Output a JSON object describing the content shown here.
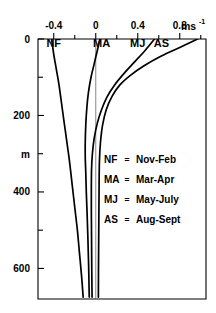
{
  "chart_data": {
    "type": "line",
    "title": "",
    "xlabel": "",
    "ylabel": "m",
    "xunit": "ms",
    "xunit_exponent": "-1",
    "orientation": "depth-profile",
    "grid": false,
    "legend_position": "inside-right-middle",
    "xlim": [
      -0.55,
      1.05
    ],
    "ylim": [
      0,
      680
    ],
    "y_inverted": true,
    "xticks": [
      -0.4,
      0,
      0.4,
      0.8
    ],
    "xtick_labels": [
      "-0.4",
      "0",
      "0.4",
      "0.8"
    ],
    "xminor_ticks": [
      -0.2,
      0.2,
      0.6,
      1.0
    ],
    "yticks": [
      0,
      200,
      400,
      600
    ],
    "ytick_labels": [
      "0",
      "200",
      "400",
      "600"
    ],
    "yminor_ticks": [
      100,
      300,
      500
    ],
    "zero_reference_line": 0,
    "series": [
      {
        "name": "NF",
        "label": "Nov-Feb",
        "points": [
          [
            -0.42,
            0
          ],
          [
            -0.4,
            40
          ],
          [
            -0.375,
            80
          ],
          [
            -0.35,
            120
          ],
          [
            -0.325,
            170
          ],
          [
            -0.3,
            220
          ],
          [
            -0.275,
            270
          ],
          [
            -0.25,
            320
          ],
          [
            -0.225,
            380
          ],
          [
            -0.2,
            440
          ],
          [
            -0.175,
            500
          ],
          [
            -0.155,
            560
          ],
          [
            -0.135,
            620
          ],
          [
            -0.12,
            675
          ]
        ]
      },
      {
        "name": "MA",
        "label": "Mar-Apr",
        "points": [
          [
            0.04,
            0
          ],
          [
            0.015,
            30
          ],
          [
            -0.015,
            65
          ],
          [
            -0.045,
            100
          ],
          [
            -0.07,
            140
          ],
          [
            -0.085,
            180
          ],
          [
            -0.095,
            225
          ],
          [
            -0.1,
            270
          ],
          [
            -0.1,
            310
          ],
          [
            -0.095,
            350
          ],
          [
            -0.09,
            400
          ],
          [
            -0.082,
            460
          ],
          [
            -0.075,
            520
          ],
          [
            -0.068,
            590
          ],
          [
            -0.062,
            675
          ]
        ]
      },
      {
        "name": "MJ",
        "label": "May-July",
        "points": [
          [
            0.56,
            0
          ],
          [
            0.47,
            30
          ],
          [
            0.37,
            60
          ],
          [
            0.27,
            90
          ],
          [
            0.18,
            120
          ],
          [
            0.11,
            150
          ],
          [
            0.055,
            185
          ],
          [
            0.015,
            220
          ],
          [
            -0.015,
            260
          ],
          [
            -0.032,
            300
          ],
          [
            -0.04,
            340
          ],
          [
            -0.042,
            390
          ],
          [
            -0.042,
            450
          ],
          [
            -0.04,
            520
          ],
          [
            -0.038,
            600
          ],
          [
            -0.035,
            675
          ]
        ]
      },
      {
        "name": "AS",
        "label": "Aug-Sept",
        "points": [
          [
            0.97,
            0
          ],
          [
            0.8,
            22
          ],
          [
            0.62,
            45
          ],
          [
            0.46,
            70
          ],
          [
            0.33,
            95
          ],
          [
            0.23,
            120
          ],
          [
            0.155,
            150
          ],
          [
            0.1,
            185
          ],
          [
            0.065,
            225
          ],
          [
            0.045,
            270
          ],
          [
            0.035,
            320
          ],
          [
            0.032,
            380
          ],
          [
            0.03,
            450
          ],
          [
            0.028,
            530
          ],
          [
            0.026,
            610
          ],
          [
            0.025,
            675
          ]
        ]
      }
    ],
    "curve_tags": [
      {
        "text": "NF",
        "x": -0.4,
        "y": 22
      },
      {
        "text": "MA",
        "x": 0.055,
        "y": 22
      },
      {
        "text": "MJ",
        "x": 0.4,
        "y": 22
      },
      {
        "text": "AS",
        "x": 0.625,
        "y": 22
      }
    ],
    "legend_entries": [
      {
        "abbr": "NF",
        "separator": "=",
        "expansion": "Nov-Feb"
      },
      {
        "abbr": "MA",
        "separator": "=",
        "expansion": "Mar-Apr"
      },
      {
        "abbr": "MJ",
        "separator": "=",
        "expansion": "May-July"
      },
      {
        "abbr": "AS",
        "separator": "=",
        "expansion": "Aug-Sept"
      }
    ],
    "colors": {
      "curve": "#000000",
      "axis": "#000000",
      "zero_line": "#555555",
      "background": "#ffffff"
    }
  }
}
